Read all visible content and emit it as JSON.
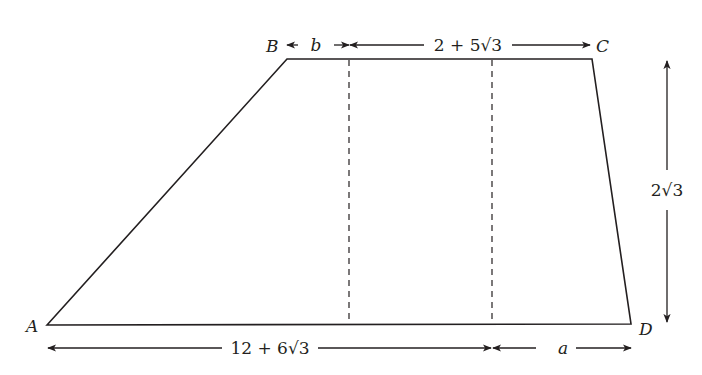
{
  "diagram": {
    "type": "trapezoid",
    "vertices": {
      "A": {
        "label": "A",
        "x": 47,
        "y": 325
      },
      "B": {
        "label": "B",
        "x": 287,
        "y": 59
      },
      "C": {
        "label": "C",
        "x": 592,
        "y": 59
      },
      "D": {
        "label": "D",
        "x": 631,
        "y": 324
      }
    },
    "dashed_lines_x": [
      349,
      492
    ],
    "dimensions": {
      "top_left": "b",
      "top_right": "2 + 5√3",
      "bottom_left": "12 + 6√3",
      "bottom_right": "a",
      "height": "2√3"
    },
    "colors": {
      "stroke": "#231f20",
      "background": "#ffffff"
    }
  }
}
